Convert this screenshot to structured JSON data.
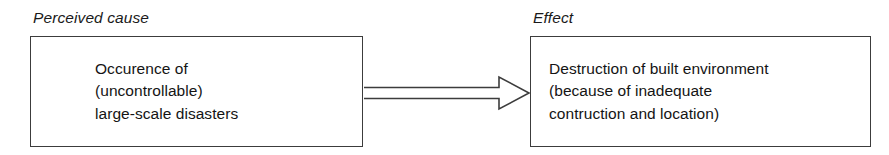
{
  "diagram": {
    "type": "cause-effect-flow",
    "background_color": "#ffffff",
    "stroke_color": "#3c3c3c",
    "text_color": "#141414",
    "captions": {
      "cause": "Perceived cause",
      "effect": "Effect"
    },
    "nodes": [
      {
        "id": "cause",
        "caption": "Perceived cause",
        "lines": [
          "Occurence of",
          "(uncontrollable)",
          "large-scale disasters"
        ],
        "text": "Occurence of\n(uncontrollable)\nlarge-scale disasters"
      },
      {
        "id": "effect",
        "caption": "Effect",
        "lines": [
          "Destruction of built environment",
          "(because of inadequate",
          "contruction and location)"
        ],
        "text": "Destruction of built environment\n(because of inadequate\ncontruction and location)"
      }
    ],
    "connector": {
      "from": "cause",
      "to": "effect",
      "style": "open-outline-arrow",
      "direction": "right",
      "label": ""
    }
  }
}
